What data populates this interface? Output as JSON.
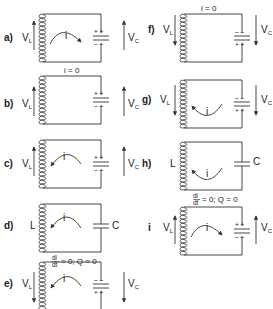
{
  "panels": [
    {
      "id": "a",
      "label": "a)",
      "left": "VL",
      "right": "VC",
      "current": "i",
      "current_dir": "clockwise",
      "vl_dir": "up",
      "vc_dir": "up",
      "cap_top": "+ +",
      "cap_bottom": "- -",
      "top_label": ""
    },
    {
      "id": "b",
      "label": "b)",
      "left": "VL",
      "right": "VC",
      "current": "",
      "vl_dir": "up",
      "vc_dir": "up",
      "cap_top": "+ +",
      "cap_bottom": "- -",
      "top_label": "i = 0"
    },
    {
      "id": "c",
      "label": "c)",
      "left": "VL",
      "right": "VC",
      "current": "i",
      "current_dir": "counterclockwise",
      "vl_dir": "up",
      "vc_dir": "up",
      "cap_top": "+ +",
      "cap_bottom": "- -",
      "top_label": ""
    },
    {
      "id": "d",
      "label": "d)",
      "left": "L",
      "right": "C",
      "current": "i",
      "current_dir": "counterclockwise",
      "bottom_label": "di/dt = 0;  Q = 0"
    },
    {
      "id": "e",
      "label": "e)",
      "left": "VL",
      "right": "VC",
      "current": "i",
      "current_dir": "counterclockwise",
      "vl_dir": "down",
      "vc_dir": "down",
      "cap_top": "- -",
      "cap_bottom": "+ +",
      "top_label": ""
    },
    {
      "id": "f",
      "label": "f)",
      "left": "VL",
      "right": "VC",
      "current": "",
      "vl_dir": "down",
      "vc_dir": "down",
      "cap_top": "- -",
      "cap_bottom": "+ +",
      "top_label": "i = 0"
    },
    {
      "id": "g",
      "label": "g)",
      "left": "VL",
      "right": "VC",
      "current": "i",
      "current_dir": "clockwise-bottom",
      "vl_dir": "down",
      "vc_dir": "down",
      "cap_top": "- -",
      "cap_bottom": "+ +",
      "top_label": ""
    },
    {
      "id": "h",
      "label": "h)",
      "left": "L",
      "right": "C",
      "current": "i",
      "current_dir": "clockwise-bottom",
      "bottom_label": "di/dt = 0;  Q = 0"
    },
    {
      "id": "i",
      "label": "i)",
      "left": "VL",
      "right": "VC",
      "current": "i",
      "current_dir": "clockwise",
      "vl_dir": "up",
      "vc_dir": "up",
      "cap_top": "+ +",
      "cap_bottom": "- -",
      "top_label": ""
    }
  ],
  "text": {
    "a": "a)",
    "b": "b)",
    "c": "c)",
    "d": "d)",
    "e": "e)",
    "f": "f)",
    "g": "g)",
    "h": "h)",
    "i": "i",
    "V": "V",
    "L_sub": "L",
    "C_sub": "C",
    "L": "L",
    "C": "C",
    "i0": "i = 0",
    "plus": "+",
    "minus": "−",
    "di": "di",
    "dt": "dt",
    "eq": "= 0;  Q = 0"
  }
}
